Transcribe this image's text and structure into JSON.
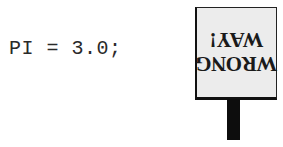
{
  "code": {
    "statement": "PI = 3.0;"
  },
  "sign": {
    "line1": "WRONG",
    "line2": "WAY!",
    "orientation": "upside-down",
    "colors": {
      "board": "#ececec",
      "border": "#111111",
      "post": "#0d0d0d",
      "text": "#1a1a1a"
    }
  }
}
